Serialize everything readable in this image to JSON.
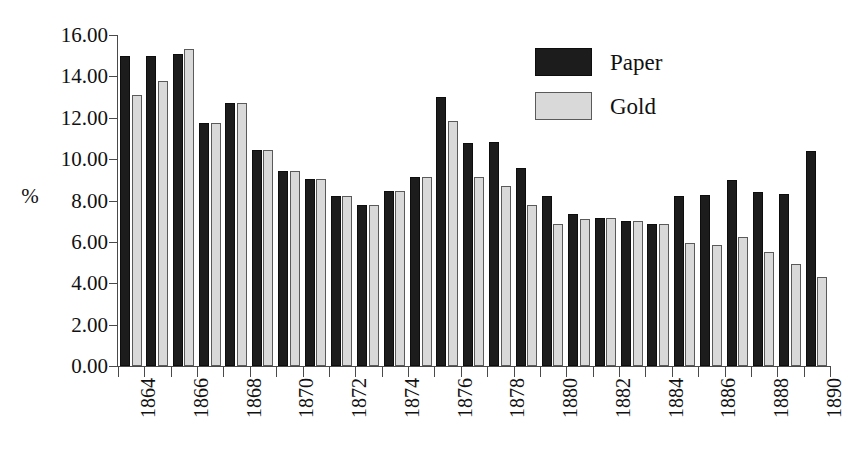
{
  "chart_data": {
    "type": "bar",
    "title": "",
    "xlabel": "",
    "ylabel": "%",
    "ylim": [
      0,
      16
    ],
    "ytick_step": 2,
    "ytick_labels": [
      "16.00",
      "14.00",
      "12.00",
      "10.00",
      "8.00",
      "6.00",
      "4.00",
      "2.00",
      "0.00"
    ],
    "ytick_values": [
      16,
      14,
      12,
      10,
      8,
      6,
      4,
      2,
      0
    ],
    "grid": false,
    "legend_position": "top-right",
    "categories": [
      "1864",
      "1865",
      "1866",
      "1867",
      "1868",
      "1869",
      "1870",
      "1871",
      "1872",
      "1873",
      "1874",
      "1875",
      "1876",
      "1877",
      "1878",
      "1879",
      "1880",
      "1881",
      "1882",
      "1883",
      "1884",
      "1885",
      "1886",
      "1887",
      "1888",
      "1889",
      "1890"
    ],
    "xtick_labels_shown": [
      "1864",
      "",
      "1866",
      "",
      "1868",
      "",
      "1870",
      "",
      "1872",
      "",
      "1874",
      "",
      "1876",
      "",
      "1878",
      "",
      "1880",
      "",
      "1882",
      "",
      "1884",
      "",
      "1886",
      "",
      "1888",
      "",
      "1890"
    ],
    "series": [
      {
        "name": "Paper",
        "color": "#1c1c1c",
        "values": [
          15.0,
          15.0,
          15.1,
          11.75,
          12.7,
          10.45,
          9.45,
          9.05,
          8.2,
          7.8,
          8.45,
          9.15,
          13.0,
          10.8,
          10.85,
          9.55,
          8.2,
          7.35,
          7.15,
          7.0,
          6.85,
          8.2,
          8.25,
          9.0,
          8.4,
          8.3,
          10.4
        ]
      },
      {
        "name": "Gold",
        "color": "#d9d9d9",
        "values": [
          13.1,
          13.8,
          15.3,
          11.75,
          12.7,
          10.45,
          9.45,
          9.05,
          8.2,
          7.8,
          8.45,
          9.15,
          11.85,
          9.15,
          8.7,
          7.8,
          6.85,
          7.1,
          7.15,
          7.0,
          6.85,
          5.95,
          5.85,
          6.25,
          5.5,
          4.95,
          4.3
        ]
      }
    ]
  },
  "legend": {
    "items": [
      {
        "label": "Paper",
        "key": "paper"
      },
      {
        "label": "Gold",
        "key": "gold"
      }
    ]
  }
}
